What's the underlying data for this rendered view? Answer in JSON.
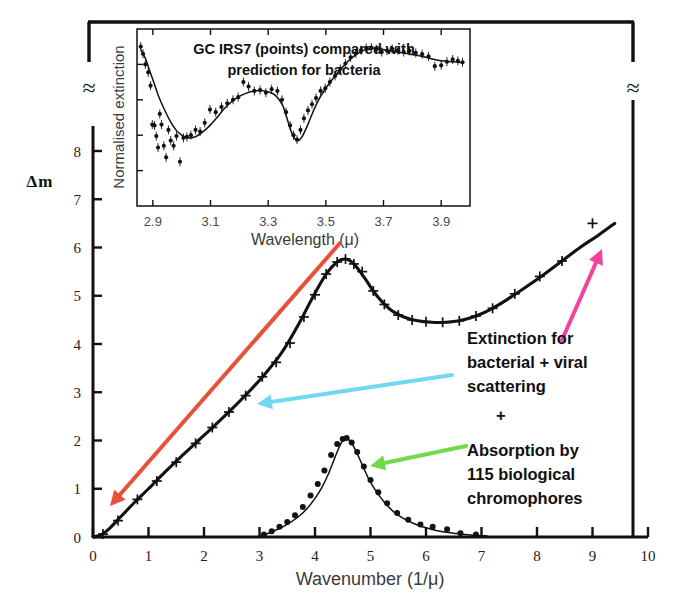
{
  "figure": {
    "background": "#ffffff",
    "axis_color": "#111111",
    "curve_color": "#121212"
  },
  "main_axes": {
    "xlabel": "Wavenumber (1/μ)",
    "ylabel": "Δm",
    "xlim": [
      0,
      10
    ],
    "ylim": [
      0,
      8.4
    ],
    "xticks": [
      0,
      1,
      2,
      3,
      4,
      5,
      6,
      7,
      8,
      9,
      10
    ],
    "xticklabels": [
      "0",
      "1",
      "2",
      "3",
      "4",
      "5",
      "6",
      "7",
      "8",
      "9",
      "10"
    ],
    "yticks": [
      0,
      1,
      2,
      3,
      4,
      5,
      6,
      7,
      8
    ],
    "yticklabels": [
      "0",
      "1",
      "2",
      "3",
      "4",
      "5",
      "6",
      "7",
      "8"
    ],
    "axis_break_symbol": "≈",
    "grid": false
  },
  "annotations": {
    "extinction_note": [
      "Extinction for",
      "bacterial + viral",
      "scattering"
    ],
    "plus_sign": "+",
    "absorption_note": [
      "Absorption by",
      "115 biological",
      "chromophores"
    ],
    "arrows": [
      {
        "name": "red-arrow",
        "color": "#E8503A",
        "from": [
          340,
          243
        ],
        "to": [
          110,
          506
        ],
        "width": 4.0
      },
      {
        "name": "cyan-arrow",
        "color": "#6FD9F2",
        "from": [
          452,
          375
        ],
        "to": [
          257,
          404
        ],
        "width": 4.0
      },
      {
        "name": "pink-arrow",
        "color": "#F0459A",
        "from": [
          562,
          340
        ],
        "to": [
          602,
          249
        ],
        "width": 4.0
      },
      {
        "name": "green-arrow",
        "color": "#74D94A",
        "from": [
          466,
          446
        ],
        "to": [
          370,
          466
        ],
        "width": 4.0
      }
    ]
  },
  "inset": {
    "title": [
      "GC IRS7 (points) compared with",
      "prediction for bacteria"
    ],
    "xlabel": "Wavelength (μ)",
    "ylabel": "Normalised extinction",
    "xlim": [
      2.845,
      4.0
    ],
    "xticks": [
      2.9,
      3.1,
      3.3,
      3.5,
      3.7,
      3.9
    ],
    "xticklabels": [
      "2.9",
      "3.1",
      "3.3",
      "3.5",
      "3.7",
      "3.9"
    ],
    "yticks_count": 4,
    "grid": false
  },
  "chart_data": [
    {
      "type": "line",
      "name": "extinction-bacterial-viral-scattering",
      "title": "Extinction for bacterial + viral scattering",
      "xlabel": "Wavenumber (1/μ)",
      "ylabel": "Δm",
      "xlim": [
        0,
        10
      ],
      "ylim": [
        0,
        8.4
      ],
      "marker": "plus",
      "x": [
        0.0,
        0.15,
        0.3,
        0.5,
        0.75,
        1.0,
        1.3,
        1.6,
        1.9,
        2.2,
        2.5,
        2.8,
        3.1,
        3.4,
        3.7,
        3.95,
        4.2,
        4.4,
        4.55,
        4.7,
        4.9,
        5.1,
        5.35,
        5.6,
        5.85,
        6.1,
        6.35,
        6.6,
        6.9,
        7.2,
        7.5,
        7.8,
        8.1,
        8.45,
        8.8,
        9.1,
        9.4
      ],
      "y": [
        0.0,
        0.05,
        0.18,
        0.42,
        0.72,
        1.0,
        1.35,
        1.68,
        2.0,
        2.32,
        2.65,
        3.0,
        3.38,
        3.82,
        4.4,
        4.95,
        5.45,
        5.7,
        5.76,
        5.66,
        5.36,
        5.02,
        4.72,
        4.56,
        4.48,
        4.45,
        4.45,
        4.48,
        4.58,
        4.74,
        4.95,
        5.18,
        5.42,
        5.72,
        6.02,
        6.25,
        6.5
      ],
      "marker_x": [
        0.18,
        0.45,
        0.8,
        1.15,
        1.5,
        1.85,
        2.15,
        2.45,
        2.75,
        3.05,
        3.3,
        3.55,
        3.8,
        4.0,
        4.2,
        4.4,
        4.55,
        4.7,
        4.85,
        5.05,
        5.25,
        5.5,
        5.75,
        6.0,
        6.3,
        6.6,
        6.9,
        7.2,
        7.6,
        8.05,
        8.45,
        9.0
      ],
      "marker_y": [
        0.06,
        0.34,
        0.78,
        1.16,
        1.55,
        1.94,
        2.27,
        2.59,
        2.93,
        3.32,
        3.62,
        4.02,
        4.56,
        5.02,
        5.45,
        5.7,
        5.76,
        5.66,
        5.5,
        5.1,
        4.82,
        4.6,
        4.5,
        4.46,
        4.45,
        4.48,
        4.58,
        4.74,
        5.04,
        5.4,
        5.72,
        6.5
      ]
    },
    {
      "type": "line",
      "name": "absorption-115-biological-chromophores",
      "title": "Absorption by 115 biological chromophores",
      "xlabel": "Wavenumber (1/μ)",
      "ylabel": "Δm",
      "xlim": [
        0,
        10
      ],
      "ylim": [
        0,
        8.4
      ],
      "marker": "dot",
      "x": [
        2.95,
        3.1,
        3.25,
        3.4,
        3.55,
        3.7,
        3.85,
        4.0,
        4.12,
        4.24,
        4.36,
        4.46,
        4.55,
        4.64,
        4.74,
        4.85,
        4.97,
        5.1,
        5.25,
        5.42,
        5.6,
        5.8,
        6.0,
        6.25,
        6.5,
        6.8,
        7.1
      ],
      "y": [
        0.0,
        0.05,
        0.12,
        0.2,
        0.3,
        0.42,
        0.58,
        0.8,
        1.02,
        1.3,
        1.65,
        1.92,
        2.05,
        1.98,
        1.78,
        1.5,
        1.2,
        0.95,
        0.72,
        0.52,
        0.38,
        0.27,
        0.19,
        0.12,
        0.08,
        0.04,
        0.02
      ],
      "marker_x": [
        3.08,
        3.22,
        3.36,
        3.5,
        3.64,
        3.78,
        3.92,
        4.05,
        4.17,
        4.29,
        4.4,
        4.5,
        4.57,
        4.66,
        4.76,
        4.88,
        5.0,
        5.14,
        5.3,
        5.48,
        5.68,
        5.9,
        6.12,
        6.38,
        6.62,
        6.9
      ],
      "marker_y": [
        0.05,
        0.12,
        0.21,
        0.31,
        0.45,
        0.62,
        0.86,
        1.1,
        1.38,
        1.7,
        1.93,
        2.03,
        2.05,
        1.96,
        1.76,
        1.46,
        1.18,
        0.93,
        0.7,
        0.5,
        0.36,
        0.26,
        0.21,
        0.16,
        0.08,
        0.05
      ]
    },
    {
      "type": "line",
      "name": "gc-irs7-inset-spectrum",
      "title": "GC IRS7 (points) compared with prediction for bacteria",
      "xlabel": "Wavelength (μ)",
      "ylabel": "Normalised extinction",
      "xlim": [
        2.845,
        4.0
      ],
      "ylim": [
        0,
        1
      ],
      "marker": "dot-errorbar",
      "x": [
        2.86,
        2.875,
        2.89,
        2.905,
        2.92,
        2.94,
        2.96,
        2.98,
        3.0,
        3.02,
        3.045,
        3.07,
        3.095,
        3.12,
        3.145,
        3.17,
        3.195,
        3.22,
        3.245,
        3.27,
        3.3,
        3.325,
        3.35,
        3.37,
        3.385,
        3.4,
        3.415,
        3.435,
        3.455,
        3.475,
        3.5,
        3.525,
        3.55,
        3.575,
        3.6,
        3.625,
        3.65,
        3.68,
        3.71,
        3.74,
        3.78,
        3.82,
        3.86,
        3.9,
        3.94,
        3.975
      ],
      "y": [
        0.88,
        0.83,
        0.76,
        0.69,
        0.62,
        0.545,
        0.48,
        0.43,
        0.4,
        0.385,
        0.39,
        0.415,
        0.45,
        0.495,
        0.545,
        0.585,
        0.615,
        0.635,
        0.648,
        0.652,
        0.645,
        0.625,
        0.57,
        0.47,
        0.4,
        0.37,
        0.385,
        0.45,
        0.53,
        0.6,
        0.665,
        0.72,
        0.77,
        0.815,
        0.85,
        0.875,
        0.888,
        0.89,
        0.88,
        0.872,
        0.862,
        0.85,
        0.835,
        0.82,
        0.815,
        0.81
      ],
      "points_x": [
        2.858,
        2.866,
        2.874,
        2.884,
        2.892,
        2.898,
        2.906,
        2.912,
        2.918,
        2.924,
        2.93,
        2.938,
        2.946,
        2.954,
        2.962,
        2.972,
        2.982,
        2.994,
        3.006,
        3.018,
        3.032,
        3.048,
        3.064,
        3.08,
        3.098,
        3.118,
        3.138,
        3.158,
        3.178,
        3.196,
        3.214,
        3.232,
        3.252,
        3.272,
        3.292,
        3.312,
        3.332,
        3.348,
        3.362,
        3.376,
        3.388,
        3.4,
        3.412,
        3.424,
        3.438,
        3.452,
        3.466,
        3.482,
        3.498,
        3.514,
        3.532,
        3.55,
        3.568,
        3.586,
        3.604,
        3.622,
        3.64,
        3.658,
        3.676,
        3.694,
        3.712,
        3.73,
        3.75,
        3.77,
        3.79,
        3.812,
        3.834,
        3.856,
        3.878,
        3.9,
        3.92,
        3.94,
        3.958,
        3.974
      ],
      "points_y": [
        0.9,
        0.86,
        0.8,
        0.755,
        0.68,
        0.46,
        0.455,
        0.395,
        0.33,
        0.52,
        0.46,
        0.34,
        0.275,
        0.43,
        0.37,
        0.34,
        0.395,
        0.25,
        0.385,
        0.39,
        0.4,
        0.43,
        0.42,
        0.47,
        0.545,
        0.53,
        0.56,
        0.58,
        0.6,
        0.615,
        0.7,
        0.675,
        0.65,
        0.655,
        0.64,
        0.66,
        0.65,
        0.6,
        0.53,
        0.455,
        0.4,
        0.375,
        0.43,
        0.495,
        0.54,
        0.575,
        0.61,
        0.65,
        0.665,
        0.7,
        0.735,
        0.775,
        0.805,
        0.84,
        0.862,
        0.88,
        0.892,
        0.895,
        0.885,
        0.87,
        0.878,
        0.888,
        0.88,
        0.87,
        0.876,
        0.865,
        0.858,
        0.845,
        0.79,
        0.795,
        0.815,
        0.828,
        0.82,
        0.812
      ]
    }
  ]
}
